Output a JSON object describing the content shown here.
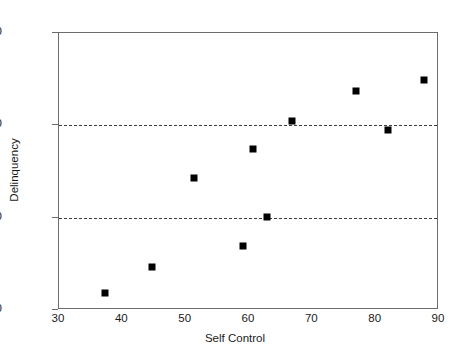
{
  "chart_data": {
    "type": "scatter",
    "title": "",
    "xlabel": "Self Control",
    "ylabel": "Delinquency",
    "xlim": [
      30,
      90
    ],
    "ylim": [
      0,
      30
    ],
    "xticks": [
      30,
      40,
      50,
      60,
      70,
      80,
      90
    ],
    "yticks": [
      0,
      10,
      20,
      30
    ],
    "grid": false,
    "reference_lines": {
      "orientation": "horizontal",
      "style": "dashed",
      "values": [
        10,
        20
      ]
    },
    "legend": null,
    "marker": "square",
    "marker_color": "#000000",
    "points": [
      {
        "x": 37.4,
        "y": 1.7
      },
      {
        "x": 44.9,
        "y": 4.5
      },
      {
        "x": 51.5,
        "y": 14.2
      },
      {
        "x": 59.2,
        "y": 6.8
      },
      {
        "x": 60.8,
        "y": 17.3
      },
      {
        "x": 63.0,
        "y": 10.0
      },
      {
        "x": 66.9,
        "y": 20.4
      },
      {
        "x": 77.1,
        "y": 23.6
      },
      {
        "x": 82.1,
        "y": 19.4
      },
      {
        "x": 87.8,
        "y": 24.8
      }
    ],
    "x": [
      37.4,
      44.9,
      51.5,
      59.2,
      60.8,
      63.0,
      66.9,
      77.1,
      82.1,
      87.8
    ],
    "values": [
      1.7,
      4.5,
      14.2,
      6.8,
      17.3,
      10.0,
      20.4,
      23.6,
      19.4,
      24.8
    ]
  },
  "axis_labels": {
    "x_title": "Self Control",
    "y_title": "Delinquency",
    "x_tick_0": "30",
    "x_tick_1": "40",
    "x_tick_2": "50",
    "x_tick_3": "60",
    "x_tick_4": "70",
    "x_tick_5": "80",
    "x_tick_6": "90",
    "y_tick_0": "0",
    "y_tick_1": "10",
    "y_tick_2": "20",
    "y_tick_3": "30"
  },
  "colors": {
    "marker": "#000000",
    "frame": "#6b6b6b",
    "dashed_line": "#3d3d3d",
    "background": "#ffffff"
  }
}
